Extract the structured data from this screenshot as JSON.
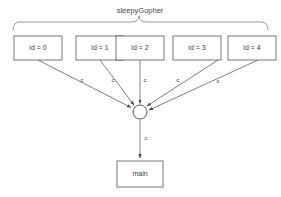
{
  "canvas": {
    "width": 281,
    "height": 197,
    "background": "#ffffff",
    "line_color": "#555555",
    "brace_color": "#888888",
    "text_color": "#3a3a3a"
  },
  "group": {
    "title": "sleepyGopher",
    "brace_label_x": 140,
    "brace_label_y": 10
  },
  "goroutine_nodes": [
    {
      "label": "id = 0",
      "x": 14,
      "y": 36,
      "w": 48,
      "h": 24,
      "cx": 38,
      "cy": 48
    },
    {
      "label": "id = 1",
      "x": 76,
      "y": 36,
      "w": 48,
      "h": 24,
      "cx": 100,
      "cy": 48
    },
    {
      "label": "id = 2",
      "x": 139,
      "y": 36,
      "w": 48,
      "h": 24,
      "cx": 163,
      "cy": 48
    },
    {
      "label": "id = 3",
      "x": 201,
      "y": 36,
      "w": 48,
      "h": 24,
      "cx": 225,
      "cy": 48
    },
    {
      "label": "id = 4",
      "x": 264,
      "y": 36,
      "w": 48,
      "h": 24,
      "cx": 288,
      "cy": 48
    }
  ],
  "channel_node": {
    "name": "channel-junction",
    "cx": 139,
    "cy": 112,
    "r": 7
  },
  "main_node": {
    "label": "main",
    "x": 117,
    "y": 161,
    "w": 46,
    "h": 26,
    "cx": 140,
    "cy": 174
  },
  "edges": [
    {
      "from": "id = 0",
      "to": "channel",
      "label": "c",
      "label_x": 82,
      "label_y": 80
    },
    {
      "from": "id = 1",
      "to": "channel",
      "label": "c",
      "label_x": 113,
      "label_y": 80
    },
    {
      "from": "id = 2",
      "to": "channel",
      "label": "c",
      "label_x": 145,
      "label_y": 80
    },
    {
      "from": "id = 3",
      "to": "channel",
      "label": "c",
      "label_x": 178,
      "label_y": 80
    },
    {
      "from": "id = 4",
      "to": "channel",
      "label": "c",
      "label_x": 218,
      "label_y": 81
    },
    {
      "from": "channel",
      "to": "main",
      "label": "c",
      "label_x": 146,
      "label_y": 138
    }
  ]
}
